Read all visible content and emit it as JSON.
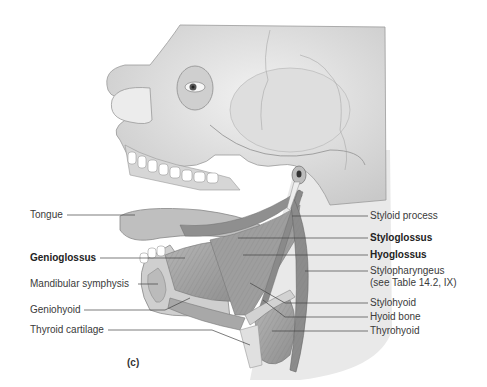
{
  "figure": {
    "panel_label": "(c)",
    "labels_left": [
      {
        "text": "Tongue",
        "bold": false
      },
      {
        "text": "Genioglossus",
        "bold": true
      },
      {
        "text": "Mandibular symphysis",
        "bold": false
      },
      {
        "text": "Geniohyoid",
        "bold": false
      },
      {
        "text": "Thyroid cartilage",
        "bold": false
      }
    ],
    "labels_right": [
      {
        "text": "Styloid process",
        "bold": false
      },
      {
        "text": "Styloglossus",
        "bold": true
      },
      {
        "text": "Hyoglossus",
        "bold": true
      },
      {
        "text": "Stylopharyngeus",
        "bold": false
      },
      {
        "text": "(see Table 14.2, IX)",
        "bold": false
      },
      {
        "text": "Stylohyoid",
        "bold": false
      },
      {
        "text": "Hyoid bone",
        "bold": false
      },
      {
        "text": "Thyrohyoid",
        "bold": false
      }
    ]
  }
}
